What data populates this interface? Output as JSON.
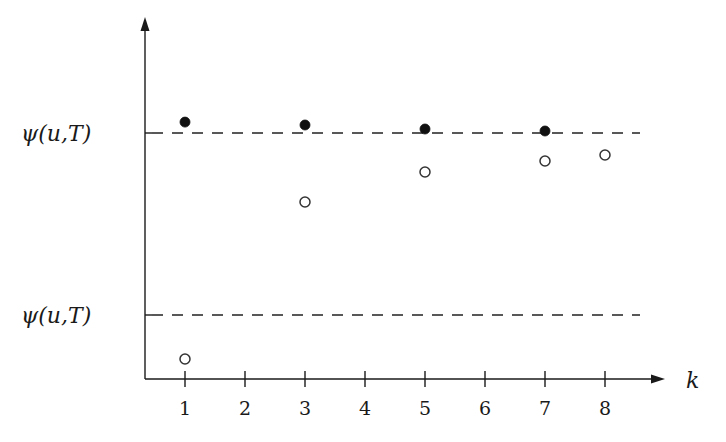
{
  "chart_data": {
    "type": "scatter",
    "title": "",
    "xlabel": "k",
    "ylabel": "",
    "x_ticks": [
      1,
      2,
      3,
      4,
      5,
      6,
      7,
      8
    ],
    "xlim": [
      0.33,
      8.6
    ],
    "ylim": [
      -0.35,
      1.6
    ],
    "grid": false,
    "legend": null,
    "reference_lines": [
      {
        "label": "ψ(u,T)",
        "y": 1.0,
        "style": "dashed",
        "note": "upper bound"
      },
      {
        "label": "ψ(u,T)",
        "y": 0.0,
        "style": "dashed",
        "note": "lower bound"
      }
    ],
    "series": [
      {
        "name": "upper estimates",
        "marker": "filled-circle",
        "x": [
          1,
          3,
          5,
          7
        ],
        "y": [
          1.06,
          1.044,
          1.022,
          1.011
        ]
      },
      {
        "name": "lower estimates",
        "marker": "open-circle",
        "x": [
          1,
          3,
          5,
          7,
          8
        ],
        "y": [
          -0.242,
          0.621,
          0.786,
          0.846,
          0.879
        ]
      }
    ]
  },
  "labels": {
    "upper_line": "ψ(u,T)",
    "lower_line": "ψ(u,T)",
    "x_axis": "k",
    "ticks": [
      "1",
      "2",
      "3",
      "4",
      "5",
      "6",
      "7",
      "8"
    ]
  },
  "colors": {
    "ink": "#1a1a1a",
    "background": "#ffffff"
  }
}
